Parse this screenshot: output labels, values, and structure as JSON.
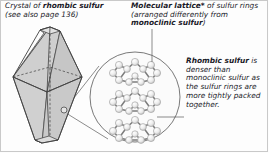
{
  "figure": {
    "background_color": "#fdfdfd",
    "border_color": "#c9c9c9"
  },
  "captions": {
    "crystal": {
      "bold_lead": "Crystal of ",
      "bold_term": "rhombic sulfur",
      "subtext": "(see also page 136)"
    },
    "lattice": {
      "bold_term": "Molecular lattice*",
      "mid_text": " of sulfur rings (arranged differently from ",
      "bold_term2": "monoclinic sulfur",
      "tail_text": ")"
    },
    "density": {
      "bold_term": "Rhombic sulfur",
      "body": " is denser than monoclinic sulfur as the sulfur rings are more tightly packed together."
    }
  },
  "crystal": {
    "name": "rhombic-sulfur-bipyramid",
    "fill_color": "#d2d2d2",
    "fill_color_light": "#dcdcdc",
    "fill_color_dark": "#c2c2c2",
    "stroke_color": "#4a4a4a",
    "hidden_edge_style": "dashed"
  },
  "inset": {
    "name": "magnified-lattice-circle",
    "fill_color": "#fbfbfb",
    "stroke_color": "#6a6a6a",
    "center_x": 135,
    "center_y": 97,
    "radius": 45,
    "ring_count": 3,
    "ring_label": "S8 crown ring",
    "atom_fill": "#e8e8e8",
    "atom_stroke": "#8a8a8a",
    "bond_color": "#7a7a7a"
  },
  "leaders": {
    "lattice_pointer": "vertical line from lattice caption into inset",
    "density_pointer": "line from density caption to an atom in inset",
    "magnifier_cone": "two lines from crystal marker to inset circle",
    "color": "#5a5a5a"
  },
  "marker": {
    "name": "magnification-source-point",
    "x": 64,
    "y": 110,
    "r": 3
  }
}
